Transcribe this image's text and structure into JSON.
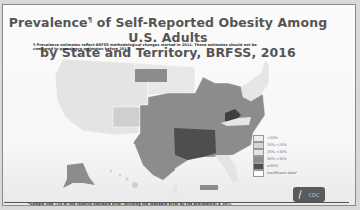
{
  "title": {
    "line1": "Prevalence",
    "superscript": "¶",
    "line1_rest": " of Self-Reported Obesity Among U.S. Adults",
    "line2": "by State and Territory, BRFSS, 2016"
  },
  "footnote_top": "¶ Prevalence estimates reflect BRFSS methodological changes started in 2011. These estimates should not be compared to prevalence estimates before 2011.",
  "footnote_bottom": "*Sample size <50 or the relative standard error (dividing the standard error by the prevalence) ≥ 30%.",
  "logo": {
    "text": "CDC",
    "icon": "hhs-eagle-icon"
  },
  "legend": [
    {
      "label": "<20%",
      "color": "#eeeeee"
    },
    {
      "label": "20%-<25%",
      "color": "#d6d6d6"
    },
    {
      "label": "25%-<30%",
      "color": "#e4e4e4"
    },
    {
      "label": "30%-<35%",
      "color": "#8c8c8c"
    },
    {
      "label": "≥35%",
      "color": "#4e4e4e"
    },
    {
      "label": "Insufficient data*",
      "color": "#ffffff"
    }
  ],
  "colors": {
    "west": "#e4e4e4",
    "colorado": "#cfcfcf",
    "midwest_south": "#8c8c8c",
    "deep_south": "#4e4e4e",
    "west_virginia": "#3f3f3f",
    "northeast": "#e6e6e6"
  }
}
